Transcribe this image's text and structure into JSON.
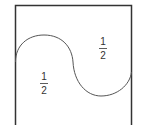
{
  "diagram": {
    "colors": {
      "stroke": "#333333",
      "curve": "#555555",
      "text": "#333333",
      "background": "#ffffff"
    },
    "regions": [
      {
        "label": "left-lower-region",
        "numerator": "1",
        "denominator": "2"
      },
      {
        "label": "right-upper-region",
        "numerator": "1",
        "denominator": "2"
      }
    ]
  }
}
